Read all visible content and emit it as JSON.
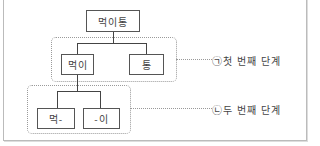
{
  "diagram": {
    "type": "tree",
    "root": {
      "label": "먹이통"
    },
    "stage1": {
      "label": "㉠첫 번째 단계",
      "nodes": [
        {
          "label": "먹이"
        },
        {
          "label": "통"
        }
      ]
    },
    "stage2": {
      "label": "㉡두 번째 단계",
      "nodes": [
        {
          "label": "먹-"
        },
        {
          "label": "-이"
        }
      ]
    },
    "colors": {
      "line": "#444444",
      "group_border": "#9a9a9a",
      "frame_border": "#bbbbbb"
    }
  }
}
